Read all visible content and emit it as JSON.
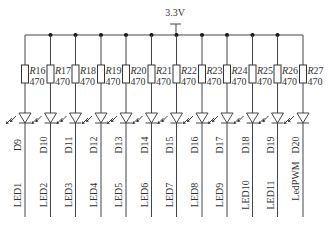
{
  "schematic": {
    "supply_label": "3.3V",
    "columns": [
      {
        "resistor": "R16",
        "ref_prefix": "R",
        "ref_num": "16",
        "value": "470",
        "diode": "D9",
        "net": "LED1"
      },
      {
        "resistor": "R17",
        "ref_prefix": "R",
        "ref_num": "17",
        "value": "470",
        "diode": "D10",
        "net": "LED2"
      },
      {
        "resistor": "R18",
        "ref_prefix": "R",
        "ref_num": "18",
        "value": "470",
        "diode": "D11",
        "net": "LED3"
      },
      {
        "resistor": "R19",
        "ref_prefix": "R",
        "ref_num": "19",
        "value": "470",
        "diode": "D12",
        "net": "LED4"
      },
      {
        "resistor": "R20",
        "ref_prefix": "R",
        "ref_num": "20",
        "value": "470",
        "diode": "D13",
        "net": "LED5"
      },
      {
        "resistor": "R21",
        "ref_prefix": "R",
        "ref_num": "21",
        "value": "470",
        "diode": "D14",
        "net": "LED6"
      },
      {
        "resistor": "R22",
        "ref_prefix": "R",
        "ref_num": "22",
        "value": "470",
        "diode": "D15",
        "net": "LED7"
      },
      {
        "resistor": "R23",
        "ref_prefix": "R",
        "ref_num": "23",
        "value": "470",
        "diode": "D16",
        "net": "LED8"
      },
      {
        "resistor": "R24",
        "ref_prefix": "R",
        "ref_num": "24",
        "value": "470",
        "diode": "D17",
        "net": "LED9"
      },
      {
        "resistor": "R25",
        "ref_prefix": "R",
        "ref_num": "25",
        "value": "470",
        "diode": "D18",
        "net": "LED10"
      },
      {
        "resistor": "R26",
        "ref_prefix": "R",
        "ref_num": "26",
        "value": "470",
        "diode": "D19",
        "net": "LED11"
      },
      {
        "resistor": "R27",
        "ref_prefix": "R",
        "ref_num": "27",
        "value": "470",
        "diode": "D20",
        "net": "LedPWM"
      }
    ]
  }
}
